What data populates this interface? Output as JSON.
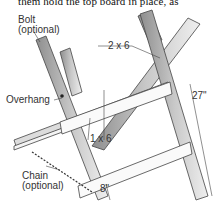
{
  "caption_fragment": "them hold the top board in place, as",
  "diagram": {
    "labels": {
      "bolt": "Bolt",
      "bolt_note": "(optional)",
      "top_board": "2 x 6",
      "overhang": "Overhang",
      "brace": "1 x 6",
      "height": "27\"",
      "chain": "Chain",
      "chain_note": "(optional)",
      "gap": "8\""
    }
  },
  "colors": {
    "wood_fill": "#e6e6e6",
    "wood_shade": "#9a9a9a",
    "line": "#444444"
  }
}
